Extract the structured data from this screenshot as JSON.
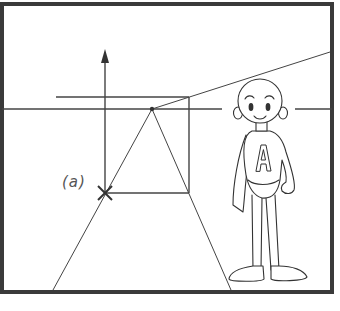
{
  "diagram": {
    "type": "perspective-drawing",
    "labels": {
      "point_a": "(a)",
      "shirt_letter": "A"
    },
    "colors": {
      "frame": "#3a3a3a",
      "line": "#444444",
      "label": "#555555",
      "background": "#ffffff"
    },
    "elements": {
      "frame": {
        "x": 2,
        "y": 4,
        "width": 330,
        "height": 288
      },
      "horizon_line_y": 109,
      "vanishing_point": {
        "x": 152,
        "y": 109
      },
      "upper_line_y": 97,
      "vertical_arrow": {
        "x": 105,
        "y_top": 50,
        "y_bottom": 193
      },
      "box": {
        "left": 105,
        "top": 97,
        "right": 189,
        "bottom": 193
      },
      "x_mark": {
        "x": 105,
        "y": 193
      },
      "convergence_lines": [
        {
          "from": [
            152,
            109
          ],
          "to": [
            53,
            290
          ]
        },
        {
          "from": [
            152,
            109
          ],
          "to": [
            231,
            290
          ]
        },
        {
          "from": [
            152,
            109
          ],
          "to": [
            330,
            52
          ]
        }
      ]
    }
  }
}
